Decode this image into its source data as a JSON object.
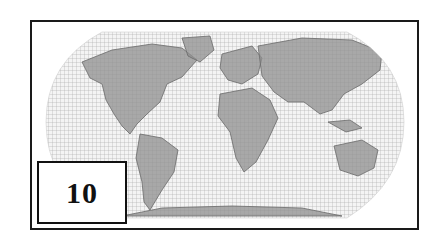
{
  "map": {
    "projection": "oval world map with graticule grid",
    "colors": {
      "land": "#9a9a9a",
      "grid": "#b8b8b8",
      "frame": "#1a1a1a",
      "background": "#ffffff"
    }
  },
  "label": {
    "number": "10"
  }
}
